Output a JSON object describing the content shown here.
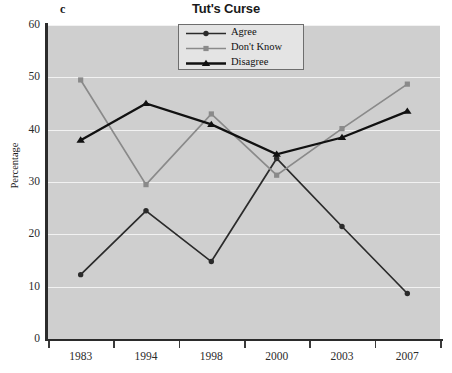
{
  "panel": {
    "label": "c"
  },
  "chart_data": {
    "type": "line",
    "title": "Tut's Curse",
    "xlabel": "",
    "ylabel": "Percentage",
    "categories": [
      "1983",
      "1994",
      "1998",
      "2000",
      "2003",
      "2007"
    ],
    "ylim": [
      0,
      60
    ],
    "yticks": [
      0,
      10,
      20,
      30,
      40,
      50,
      60
    ],
    "ytick_labels": [
      "0",
      "10",
      "20",
      "30",
      "40",
      "50",
      "60"
    ],
    "grid": true,
    "legend_position": "top-center",
    "series": [
      {
        "name": "Agree",
        "marker": "circle",
        "color": "#2b2b2b",
        "values": [
          12.3,
          24.5,
          14.8,
          34.5,
          21.5,
          8.7
        ]
      },
      {
        "name": "Don't Know",
        "marker": "square",
        "color": "#8a8a8a",
        "values": [
          49.5,
          29.5,
          43.0,
          31.3,
          40.2,
          48.7
        ]
      },
      {
        "name": "Disagree",
        "marker": "triangle",
        "color": "#111111",
        "values": [
          38.0,
          45.0,
          41.0,
          35.3,
          38.5,
          43.5
        ]
      }
    ]
  },
  "colors": {
    "plot_background": "#cfcfcf",
    "gridline": "#f2f2f2",
    "axis": "#2b2b2b",
    "legend_background": "#e4e4e4",
    "legend_border": "#6e6e6e"
  }
}
